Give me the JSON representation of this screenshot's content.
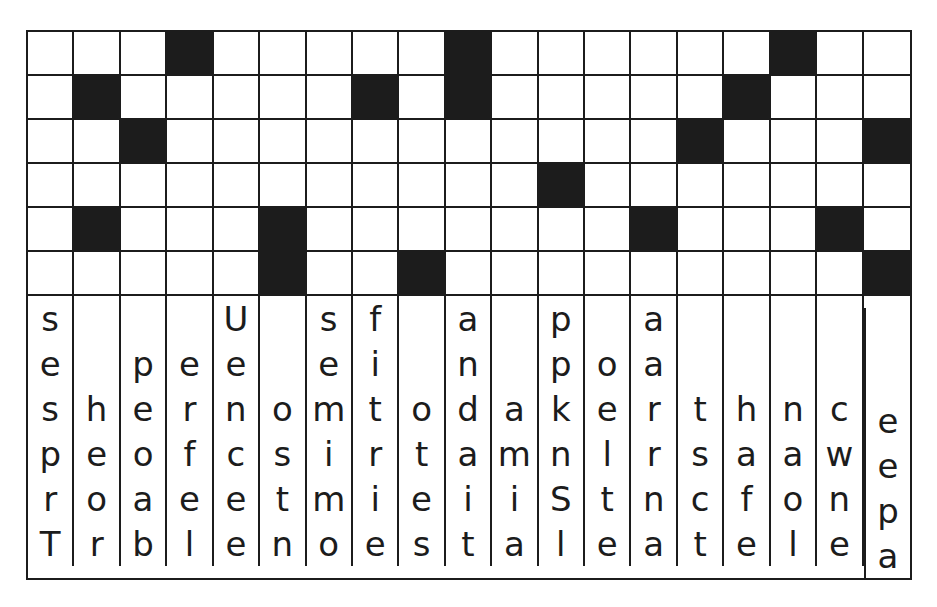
{
  "puzzle": {
    "columns": 19,
    "pattern_rows": 6,
    "letter_rows": 6,
    "colors": {
      "block": "#1c1c1c",
      "background": "#ffffff",
      "grid_line": "#1c1c1c",
      "text": "#1c1c1c"
    },
    "pattern_grid": [
      [
        "",
        "",
        "",
        "black",
        "",
        "",
        "",
        "",
        "",
        "black",
        "",
        "",
        "",
        "",
        "",
        "",
        "black",
        "",
        ""
      ],
      [
        "",
        "black",
        "",
        "",
        "",
        "",
        "",
        "black",
        "",
        "black",
        "",
        "",
        "",
        "",
        "",
        "black",
        "",
        "",
        ""
      ],
      [
        "",
        "",
        "black",
        "",
        "",
        "",
        "",
        "",
        "",
        "",
        "",
        "",
        "",
        "",
        "black",
        "",
        "",
        "",
        "black"
      ],
      [
        "",
        "",
        "",
        "",
        "",
        "",
        "",
        "",
        "",
        "",
        "",
        "black",
        "",
        "",
        "",
        "",
        "",
        "",
        ""
      ],
      [
        "",
        "black",
        "",
        "",
        "",
        "black",
        "",
        "",
        "",
        "",
        "",
        "",
        "",
        "black",
        "",
        "",
        "",
        "black",
        ""
      ],
      [
        "",
        "",
        "",
        "",
        "",
        "black",
        "",
        "",
        "black",
        "",
        "",
        "",
        "",
        "",
        "",
        "",
        "",
        "",
        "black"
      ]
    ],
    "letter_grid": [
      [
        "s",
        "",
        "",
        "",
        "U",
        "",
        "s",
        "f",
        "",
        "a",
        "",
        "p",
        "",
        "a",
        "",
        "",
        "",
        "",
        ""
      ],
      [
        "e",
        "",
        "p",
        "e",
        "e",
        "",
        "e",
        "i",
        "",
        "n",
        "",
        "p",
        "o",
        "a",
        "",
        "",
        "",
        "",
        ""
      ],
      [
        "s",
        "h",
        "e",
        "r",
        "n",
        "o",
        "m",
        "t",
        "o",
        "d",
        "a",
        "k",
        "e",
        "r",
        "t",
        "h",
        "n",
        "c",
        "d"
      ],
      [
        "p",
        "e",
        "o",
        "f",
        "c",
        "s",
        "i",
        "r",
        "t",
        "a",
        "m",
        "n",
        "l",
        "r",
        "s",
        "a",
        "a",
        "w",
        "e"
      ],
      [
        "r",
        "o",
        "a",
        "e",
        "e",
        "t",
        "m",
        "i",
        "e",
        "i",
        "i",
        "S",
        "t",
        "n",
        "c",
        "f",
        "o",
        "n",
        "t"
      ],
      [
        "T",
        "r",
        "b",
        "l",
        "e",
        "n",
        "o",
        "e",
        "s",
        "t",
        "a",
        "l",
        "e",
        "a",
        "t",
        "e",
        "l",
        "e",
        "h"
      ]
    ],
    "letter_tail_column": [
      "",
      "",
      "",
      "e",
      "e",
      "p",
      "a"
    ]
  }
}
